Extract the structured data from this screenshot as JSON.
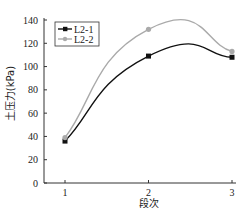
{
  "chart_data": {
    "type": "line",
    "title": "",
    "xlabel": "段次",
    "ylabel": "土压力(kPa)",
    "x": [
      1,
      2,
      3
    ],
    "categories": [
      "1",
      "2",
      "3"
    ],
    "xlim": [
      1,
      3
    ],
    "ylim": [
      0,
      140
    ],
    "yticks": [
      0,
      20,
      40,
      60,
      80,
      100,
      120,
      140
    ],
    "xticks": [
      1,
      2,
      3
    ],
    "grid": false,
    "legend_position": "upper-left",
    "smooth": true,
    "series": [
      {
        "name": "L2-1",
        "values": [
          36,
          109,
          108
        ],
        "color": "#111111",
        "marker": "square"
      },
      {
        "name": "L2-2",
        "values": [
          39,
          132,
          113
        ],
        "color": "#aaaaaa",
        "marker": "circle"
      }
    ]
  }
}
